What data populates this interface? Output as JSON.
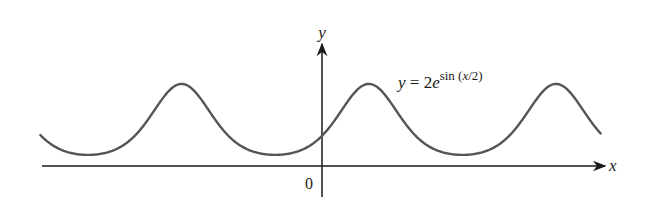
{
  "chart_data": {
    "type": "line",
    "title": "",
    "function": "y = 2e^{sin(x/2)}",
    "annotation": {
      "prefix": "y = 2e",
      "superscript": "sin (x/2)"
    },
    "xlabel": "x",
    "ylabel": "y",
    "origin_label": "0",
    "xlim": [
      -18.9,
      18.7
    ],
    "ylim": [
      0,
      5.44
    ],
    "period": "4π",
    "max_value": 5.44,
    "min_value": 0.74,
    "y_intercept": 2,
    "peaks_x": [
      -9.42,
      3.14,
      15.71
    ],
    "troughs_x": [
      -15.71,
      -3.14,
      9.42
    ],
    "grid": false,
    "legend": "none",
    "series": [
      {
        "name": "y = 2e^{sin(x/2)}",
        "x": [
          -18.85,
          -15.71,
          -12.57,
          -9.42,
          -6.28,
          -3.14,
          0,
          3.14,
          6.28,
          9.42,
          12.57,
          15.71,
          18.85
        ],
        "values": [
          2.0,
          0.74,
          2.0,
          5.44,
          2.0,
          0.74,
          2.0,
          5.44,
          2.0,
          0.74,
          2.0,
          5.44,
          2.0
        ]
      }
    ],
    "colors": {
      "curve": "#555555",
      "axes": "#1a1a1a"
    }
  }
}
